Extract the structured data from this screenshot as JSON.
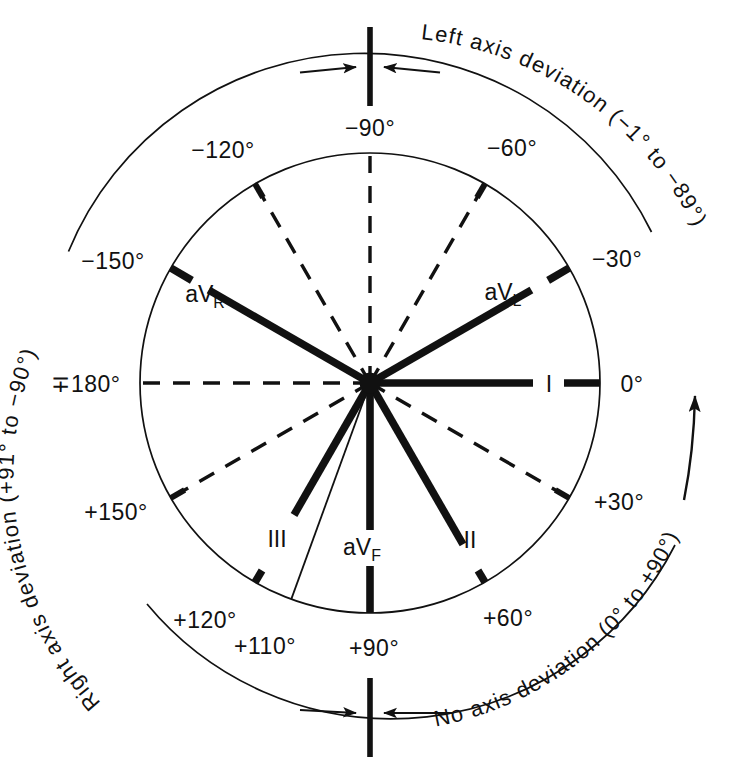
{
  "figure": {
    "center": {
      "x": 370,
      "y": 383
    },
    "radius": 230,
    "colors": {
      "ink": "#111111",
      "background": "#ffffff"
    }
  },
  "degree_labels": [
    {
      "id": "deg-minus-90",
      "text": "−90°",
      "angle": -90,
      "x": 370,
      "y": 128,
      "anchor": "middle"
    },
    {
      "id": "deg-minus-120",
      "text": "−120°",
      "angle": -120,
      "x": 223,
      "y": 150,
      "anchor": "middle"
    },
    {
      "id": "deg-minus-60",
      "text": "−60°",
      "angle": -60,
      "x": 512,
      "y": 148,
      "anchor": "middle"
    },
    {
      "id": "deg-minus-150",
      "text": "−150°",
      "angle": -150,
      "x": 113,
      "y": 261,
      "anchor": "middle"
    },
    {
      "id": "deg-minus-30",
      "text": "−30°",
      "angle": -30,
      "x": 617,
      "y": 259,
      "anchor": "middle"
    },
    {
      "id": "deg-180",
      "text": "∓180°",
      "angle": 180,
      "x": 86,
      "y": 391,
      "anchor": "middle"
    },
    {
      "id": "deg-0",
      "text": "0°",
      "angle": 0,
      "x": 630,
      "y": 391,
      "anchor": "middle"
    },
    {
      "id": "deg-plus-150",
      "text": "+150°",
      "angle": 150,
      "x": 116,
      "y": 512,
      "anchor": "middle"
    },
    {
      "id": "deg-plus-30",
      "text": "+30°",
      "angle": 30,
      "x": 619,
      "y": 502,
      "anchor": "middle"
    },
    {
      "id": "deg-plus-120",
      "text": "+120°",
      "angle": 120,
      "x": 205,
      "y": 620,
      "anchor": "middle"
    },
    {
      "id": "deg-plus-110",
      "text": "+110°",
      "angle": 110,
      "x": 265,
      "y": 646,
      "anchor": "middle"
    },
    {
      "id": "deg-plus-90",
      "text": "+90°",
      "angle": 90,
      "x": 374,
      "y": 648,
      "anchor": "middle"
    },
    {
      "id": "deg-plus-60",
      "text": "+60°",
      "angle": 60,
      "x": 508,
      "y": 618,
      "anchor": "middle"
    }
  ],
  "leads": [
    {
      "id": "lead-aVR",
      "label": "aV",
      "sub": "R",
      "angle": -150,
      "style": "solid",
      "label_x": 218,
      "label_y": 295,
      "label_anchor": "middle"
    },
    {
      "id": "lead-aVL",
      "label": "aV",
      "sub": "L",
      "angle": -30,
      "style": "solid",
      "label_x": 516,
      "label_y": 293,
      "label_anchor": "middle"
    },
    {
      "id": "lead-I",
      "label": "I",
      "sub": "",
      "angle": 0,
      "style": "solid",
      "label_x": 549,
      "label_y": 391,
      "label_anchor": "middle"
    },
    {
      "id": "lead-II",
      "label": "II",
      "sub": "",
      "angle": 60,
      "style": "solid",
      "label_x": 470,
      "label_y": 540,
      "label_anchor": "middle"
    },
    {
      "id": "lead-aVF",
      "label": "aV",
      "sub": "F",
      "angle": 90,
      "style": "solid",
      "label_x": 370,
      "label_y": 547,
      "label_anchor": "middle"
    },
    {
      "id": "lead-III",
      "label": "III",
      "sub": "",
      "angle": 120,
      "style": "solid",
      "label_x": 277,
      "label_y": 539,
      "label_anchor": "middle"
    }
  ],
  "dashed_axes": [
    {
      "id": "axis-minus-120",
      "angle": -120
    },
    {
      "id": "axis-minus-90",
      "angle": -90
    },
    {
      "id": "axis-minus-60",
      "angle": -60
    },
    {
      "id": "axis-180",
      "angle": 180
    },
    {
      "id": "axis-plus-150",
      "angle": 150
    },
    {
      "id": "axis-plus-30",
      "angle": 30
    }
  ],
  "thin_ray": {
    "id": "ray-plus-110",
    "angle": 110,
    "note": "+110°"
  },
  "annotations": {
    "left_axis_deviation": "Left axis deviation (−1° to −89°)",
    "right_axis_deviation": "Right axis deviation (+91° to −90°)",
    "no_axis_deviation": "No axis deviation (0° to +90°)"
  },
  "arcs": {
    "top_arc_label": "outer-arc-upper",
    "bottom_arc_label": "outer-arc-lower",
    "direction_arrow_label": "direction-arrow"
  }
}
